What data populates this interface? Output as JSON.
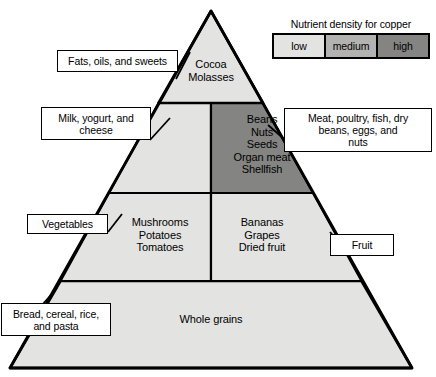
{
  "figure": {
    "type": "food-pyramid-diagram"
  },
  "colors": {
    "low": "#e3e3e1",
    "medium": "#b2b2b0",
    "high": "#848482",
    "outline": "#000000",
    "text": "#000000",
    "background": "#ffffff"
  },
  "legend": {
    "title": "Nutrient density for copper",
    "items": [
      {
        "label": "low",
        "color": "#e3e3e1"
      },
      {
        "label": "medium",
        "color": "#b2b2b0"
      },
      {
        "label": "high",
        "color": "#848482"
      }
    ]
  },
  "pyramid": {
    "tiers": [
      {
        "name": "apex",
        "cells": [
          {
            "id": "fats-oils-sweets",
            "text": "Cocoa\nMolasses",
            "density": "low"
          }
        ]
      },
      {
        "name": "upper-middle",
        "cells": [
          {
            "id": "dairy",
            "text": "",
            "density": "low"
          },
          {
            "id": "protein",
            "text": "Beans\nNuts\nSeeds\nOrgan meat\nShellfish",
            "density": "high"
          }
        ]
      },
      {
        "name": "lower-middle",
        "cells": [
          {
            "id": "vegetables",
            "text": "Mushrooms\nPotatoes\nTomatoes",
            "density": "low"
          },
          {
            "id": "fruit",
            "text": "Bananas\nGrapes\nDried fruit",
            "density": "low"
          }
        ]
      },
      {
        "name": "base",
        "cells": [
          {
            "id": "grains",
            "text": "Whole grains",
            "density": "low"
          }
        ]
      }
    ]
  },
  "callouts": {
    "fats": "Fats, oils, and sweets",
    "dairy": "Milk, yogurt, and\ncheese",
    "vegetables": "Vegetables",
    "grains": "Bread, cereal, rice,\nand pasta",
    "protein": "Meat, poultry, fish, dry\nbeans, eggs, and\nnuts",
    "fruit": "Fruit"
  }
}
